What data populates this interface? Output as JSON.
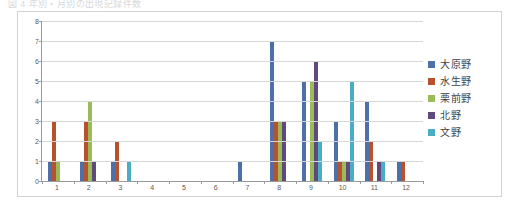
{
  "caption": {
    "text": "図 4   年別・月別の出現記録件数"
  },
  "legend": {
    "position": "right",
    "items": [
      {
        "label": "大原野",
        "color": "#4F6FA8"
      },
      {
        "label": "水生野",
        "color": "#B8512E"
      },
      {
        "label": "栗前野",
        "color": "#9BBB59"
      },
      {
        "label": "北野",
        "color": "#604A7B"
      },
      {
        "label": "文野",
        "color": "#4BACC6"
      }
    ]
  },
  "chart_data": {
    "type": "bar",
    "title": "",
    "subtitle": "",
    "xlabel": "",
    "ylabel": "",
    "grid": true,
    "legend_position": "right",
    "categories": [
      "1",
      "2",
      "3",
      "4",
      "5",
      "6",
      "7",
      "8",
      "9",
      "10",
      "11",
      "12"
    ],
    "ylim": [
      0,
      8
    ],
    "yticks": [
      0,
      1,
      2,
      3,
      4,
      5,
      6,
      7,
      8
    ],
    "series": [
      {
        "name": "大原野",
        "color": "#4F6FA8",
        "values": [
          1,
          1,
          1,
          0,
          0,
          0,
          1,
          7,
          5,
          3,
          4,
          1
        ]
      },
      {
        "name": "水生野",
        "color": "#B8512E",
        "values": [
          3,
          3,
          2,
          0,
          0,
          0,
          0,
          3,
          0,
          1,
          2,
          1
        ]
      },
      {
        "name": "栗前野",
        "color": "#9BBB59",
        "values": [
          1,
          4,
          0,
          0,
          0,
          0,
          0,
          3,
          5,
          1,
          0,
          0
        ]
      },
      {
        "name": "北野",
        "color": "#604A7B",
        "values": [
          0,
          1,
          0,
          0,
          0,
          0,
          0,
          3,
          6,
          1,
          1,
          0
        ]
      },
      {
        "name": "文野",
        "color": "#4BACC6",
        "values": [
          0,
          0,
          1,
          0,
          0,
          0,
          0,
          0,
          2,
          5,
          1,
          0
        ]
      }
    ]
  }
}
